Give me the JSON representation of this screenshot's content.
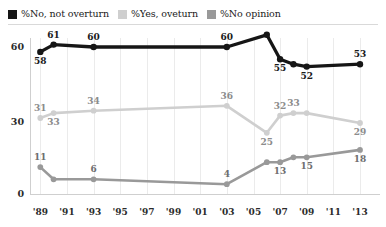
{
  "legend": {
    "entries": [
      {
        "label": "%No, not overturn",
        "color": "#161616",
        "name": "series-no-not-overturn"
      },
      {
        "label": "%Yes, oveturn",
        "color": "#cfcfcf",
        "name": "series-yes-overturn"
      },
      {
        "label": "%No opinion",
        "color": "#999999",
        "name": "series-no-opinion"
      }
    ]
  },
  "axes": {
    "y_ticks": [
      "0",
      "30",
      "60"
    ],
    "x_ticks": [
      "'89",
      "'91",
      "'93",
      "'95",
      "'97",
      "'99",
      "'01",
      "'03",
      "'05",
      "'07",
      "'09",
      "'11",
      "'13"
    ]
  },
  "chart_data": {
    "type": "line",
    "title": "",
    "subtitle": "",
    "xlabel": "",
    "ylabel": "",
    "xlim": [
      1988.4,
      1988.4
    ],
    "ylim": [
      0,
      70
    ],
    "grid": "vertical",
    "legend_position": "top-left",
    "x": [
      1989,
      1990,
      1993,
      2003,
      2006,
      2007,
      2008,
      2009,
      2013
    ],
    "x_tick_values": [
      1989,
      1991,
      1993,
      1995,
      1997,
      1999,
      2001,
      2003,
      2005,
      2007,
      2009,
      2011,
      2013
    ],
    "series": [
      {
        "name": "%No, not overturn",
        "color": "#161616",
        "values": [
          58,
          61,
          60,
          60,
          65,
          55,
          53,
          52,
          53
        ],
        "point_labels": [
          "58",
          "61",
          "60",
          "60",
          "",
          "55",
          "",
          "52",
          "53"
        ],
        "label_positions": [
          "below",
          "above",
          "above",
          "above",
          "",
          "below",
          "",
          "below",
          "above"
        ]
      },
      {
        "name": "%Yes, oveturn",
        "color": "#cfcfcf",
        "values": [
          31,
          33,
          34,
          36,
          25,
          32,
          33,
          33,
          29
        ],
        "point_labels": [
          "31",
          "33",
          "34",
          "36",
          "25",
          "32",
          "33",
          "",
          "29"
        ],
        "label_positions": [
          "above",
          "below",
          "above",
          "above",
          "below",
          "above",
          "above",
          "",
          "below"
        ]
      },
      {
        "name": "%No opinion",
        "color": "#999999",
        "values": [
          11,
          6,
          6,
          4,
          13,
          13,
          15,
          15,
          18
        ],
        "point_labels": [
          "11",
          "",
          "6",
          "4",
          "",
          "13",
          "",
          "15",
          "18"
        ],
        "label_positions": [
          "above",
          "",
          "above",
          "above",
          "",
          "below",
          "",
          "below",
          "below"
        ]
      }
    ]
  }
}
